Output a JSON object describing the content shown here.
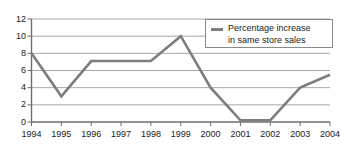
{
  "chart_data": {
    "type": "line",
    "title": "",
    "xlabel": "",
    "ylabel": "",
    "categories": [
      "1994",
      "1995",
      "1996",
      "1997",
      "1998",
      "1999",
      "2000",
      "2001",
      "2002",
      "2003",
      "2004"
    ],
    "series": [
      {
        "name": "Percentage increase in same store sales",
        "values": [
          8.0,
          3.0,
          7.1,
          7.1,
          7.1,
          10.0,
          4.0,
          0.2,
          0.2,
          4.0,
          5.5
        ],
        "color": "#7d7d7d"
      }
    ],
    "ylim": [
      0,
      12
    ],
    "yticks": [
      0,
      2,
      4,
      6,
      8,
      10,
      12
    ],
    "ytick_labels": [
      "0",
      "2",
      "4",
      "6",
      "8",
      "10",
      "12"
    ],
    "grid": true,
    "grid_color": "#a8a8a8",
    "axis_color": "#6e6e6e",
    "legend": {
      "position": "top-right",
      "line1": "Percentage increase",
      "line2": "in same store sales",
      "entries": [
        "Percentage increase in same store sales"
      ]
    }
  }
}
